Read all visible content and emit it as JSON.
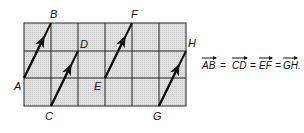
{
  "grid": {
    "columns": 6,
    "rows": 3,
    "fill": "#dcdcdc",
    "line": "#222222"
  },
  "points": {
    "A": "A",
    "B": "B",
    "C": "C",
    "D": "D",
    "E": "E",
    "F": "F",
    "G": "G",
    "H": "H"
  },
  "vectors": [
    {
      "name": "AB",
      "from": "A",
      "to": "B"
    },
    {
      "name": "CD",
      "from": "C",
      "to": "D"
    },
    {
      "name": "EF",
      "from": "E",
      "to": "F"
    },
    {
      "name": "GH",
      "from": "G",
      "to": "H"
    }
  ],
  "equation": {
    "terms": [
      "AB",
      "CD",
      "EF",
      "GH"
    ],
    "separator": "=",
    "end": "."
  }
}
